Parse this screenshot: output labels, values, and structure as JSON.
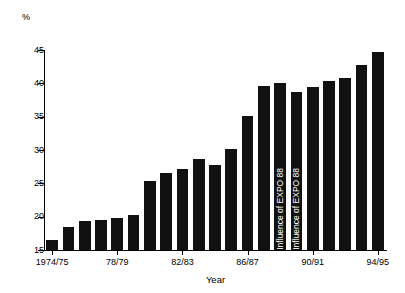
{
  "unit_label": "%",
  "chart_data": {
    "type": "bar",
    "title": "",
    "xlabel": "Year",
    "ylabel": "%",
    "ylim": [
      15,
      45
    ],
    "yticks": [
      15,
      20,
      25,
      30,
      35,
      40,
      45
    ],
    "ytick_labels": [
      "15",
      "20",
      "25",
      "30",
      "35",
      "40",
      "45"
    ],
    "grid": false,
    "legend": "none",
    "bar_color": "#111111",
    "categories": [
      "1974/75",
      "1975/76",
      "1976/77",
      "1977/78",
      "1978/79",
      "1979/80",
      "1980/81",
      "1981/82",
      "1982/83",
      "1983/84",
      "1984/85",
      "1985/86",
      "1986/87",
      "1987/88",
      "1988/89",
      "1989/90",
      "1990/91",
      "1991/92",
      "1992/93",
      "1993/94",
      "1994/95"
    ],
    "values": [
      16.5,
      18.4,
      19.3,
      19.5,
      19.8,
      20.2,
      25.4,
      26.5,
      27.2,
      28.6,
      27.7,
      30.1,
      35.1,
      39.6,
      40.1,
      38.7,
      39.4,
      40.4,
      40.8,
      42.7,
      44.7
    ],
    "xtick_labels": [
      "1974/75",
      "78/79",
      "82/83",
      "86/87",
      "90/91",
      "94/95"
    ],
    "xtick_indices": [
      0,
      4,
      8,
      12,
      16,
      20
    ],
    "annotations": [
      {
        "bar_index": 14,
        "text": "Influence of EXPO 88",
        "orientation": "vertical",
        "color": "#ffffff"
      },
      {
        "bar_index": 15,
        "text": "Influence of EXPO 88",
        "orientation": "vertical",
        "color": "#ffffff"
      }
    ]
  }
}
